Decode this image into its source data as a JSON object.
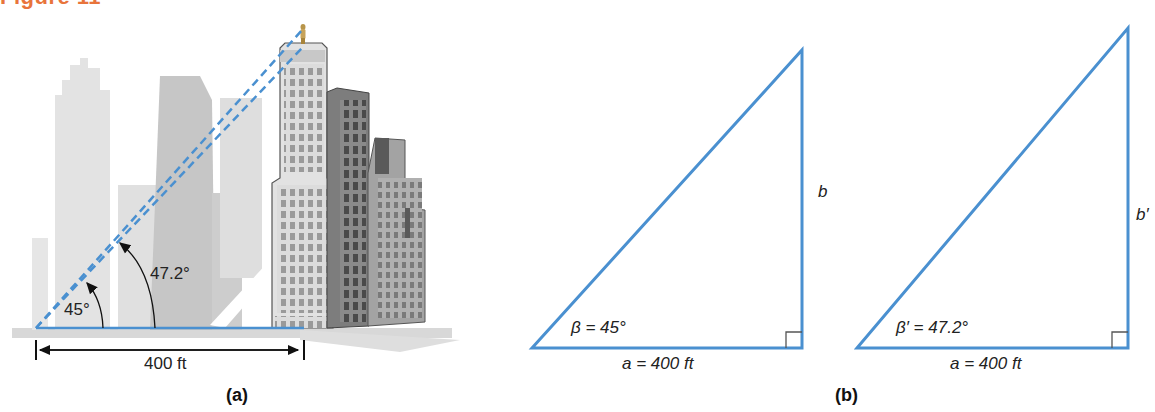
{
  "figure": {
    "title": "Figure 11",
    "accent_color": "#e8743b",
    "line_color": "#4a90d0"
  },
  "panel_a": {
    "caption": "(a)",
    "angle_small_label": "45°",
    "angle_large_label": "47.2°",
    "distance_label": "400 ft",
    "illustration": "city skyline with observer on rooftop of tall building; dashed sight lines at 45° and 47.2°"
  },
  "panel_b": {
    "caption": "(b)",
    "triangle_1": {
      "angle_label": "β = 45°",
      "base_label": "a = 400 ft",
      "height_label": "b"
    },
    "triangle_2": {
      "angle_label": "β′ = 47.2°",
      "base_label": "a = 400 ft",
      "height_label": "b′"
    }
  }
}
